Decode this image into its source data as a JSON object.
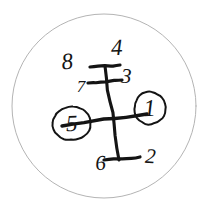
{
  "diagram": {
    "type": "gear-shift-pattern",
    "style": "hand-drawn sketch",
    "background_color": "#ffffff",
    "ink_color": "#141414",
    "outline_color": "#b4b4b4",
    "canvas": {
      "width": 217,
      "height": 212
    },
    "boundary": {
      "name": "outer-circle",
      "shape": "circle",
      "center_x": 104,
      "center_y": 106,
      "radius": 92,
      "stroke_width": 1,
      "color": "#b4b4b4"
    },
    "lever": {
      "name": "shift-lever-cross",
      "center_x": 112,
      "center_y": 118,
      "vertical_rail": {
        "x1": 105,
        "y1": 66,
        "x2": 119,
        "y2": 160
      },
      "horizontal_rail": {
        "x1": 62,
        "y1": 126,
        "x2": 147,
        "y2": 114
      }
    },
    "detents": [
      {
        "name": "detent-top-upper",
        "x1": 90,
        "y1": 67,
        "x2": 120,
        "y2": 65
      },
      {
        "name": "detent-top-lower",
        "x1": 88,
        "y1": 83,
        "x2": 122,
        "y2": 80
      },
      {
        "name": "detent-bottom",
        "x1": 104,
        "y1": 160,
        "x2": 140,
        "y2": 157
      }
    ],
    "gears": [
      {
        "id": "gear-1",
        "label": "1",
        "x": 150,
        "y": 116,
        "circled": true,
        "circle_rx": 16,
        "circle_ry": 16,
        "font_size": 24,
        "rotate": -3
      },
      {
        "id": "gear-2",
        "label": "2",
        "x": 150,
        "y": 163,
        "circled": false,
        "font_size": 21,
        "rotate": 4
      },
      {
        "id": "gear-3",
        "label": "3",
        "x": 126,
        "y": 83,
        "circled": false,
        "font_size": 21,
        "rotate": 2
      },
      {
        "id": "gear-4",
        "label": "4",
        "x": 117,
        "y": 55,
        "circled": false,
        "font_size": 23,
        "rotate": -2
      },
      {
        "id": "gear-5",
        "label": "5",
        "x": 72,
        "y": 131,
        "circled": true,
        "circle_rx": 19,
        "circle_ry": 17,
        "font_size": 23,
        "rotate": -2
      },
      {
        "id": "gear-6",
        "label": "6",
        "x": 101,
        "y": 170,
        "circled": false,
        "font_size": 21,
        "rotate": -4
      },
      {
        "id": "gear-7",
        "label": "7",
        "x": 81,
        "y": 92,
        "circled": false,
        "font_size": 17,
        "rotate": 0
      },
      {
        "id": "gear-8",
        "label": "8",
        "x": 68,
        "y": 69,
        "circled": false,
        "font_size": 23,
        "rotate": -6
      }
    ],
    "selected_gears": [
      "1",
      "5"
    ],
    "gear_count": 8
  }
}
